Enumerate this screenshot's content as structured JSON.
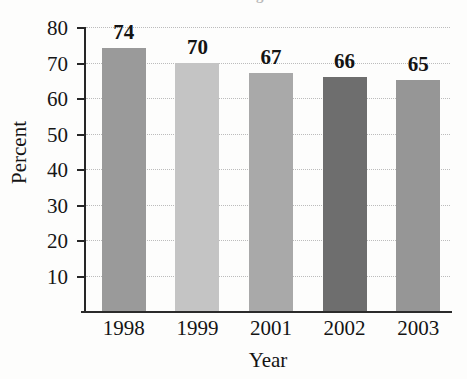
{
  "chart_data": {
    "type": "bar",
    "title": "",
    "title_cutoff_text": "Percentage",
    "xlabel": "Year",
    "ylabel": "Percent",
    "categories": [
      "1998",
      "1999",
      "2001",
      "2002",
      "2003"
    ],
    "values": [
      74,
      70,
      67,
      66,
      65
    ],
    "value_labels": [
      "74",
      "70",
      "67",
      "66",
      "65"
    ],
    "ylim": [
      0,
      80
    ],
    "ytick_labels": [
      "10",
      "20",
      "30",
      "40",
      "50",
      "60",
      "70",
      "80"
    ],
    "ytick_values": [
      10,
      20,
      30,
      40,
      50,
      60,
      70,
      80
    ],
    "grid": true,
    "grid_orientation": "horizontal",
    "grid_style": "dotted",
    "legend": false,
    "bar_colors": [
      "#9a9a9a",
      "#c4c4c4",
      "#a9a9a9",
      "#6e6e6e",
      "#969696"
    ],
    "axis_color": "#262626",
    "grid_color": "#bcbcbc"
  }
}
